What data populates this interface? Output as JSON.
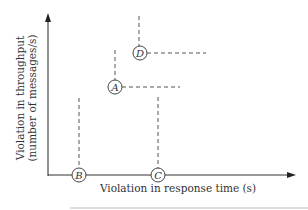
{
  "diagram": {
    "x_axis_label": "Violation in response time (s)",
    "y_axis_label_line1": "Violation in throughput",
    "y_axis_label_line2": "(number of messages/s)",
    "points": [
      {
        "id": "A",
        "label": "A",
        "description": "moderate response-time violation, moderate throughput violation"
      },
      {
        "id": "B",
        "label": "B",
        "description": "on response-time axis, small response-time violation, no throughput violation"
      },
      {
        "id": "C",
        "label": "C",
        "description": "on response-time axis, larger response-time violation, no throughput violation"
      },
      {
        "id": "D",
        "label": "D",
        "description": "larger response-time and throughput violation than A"
      }
    ],
    "colors": {
      "axis": "#333333",
      "dash": "#555555",
      "text": "#333333",
      "background": "#ffffff"
    }
  }
}
